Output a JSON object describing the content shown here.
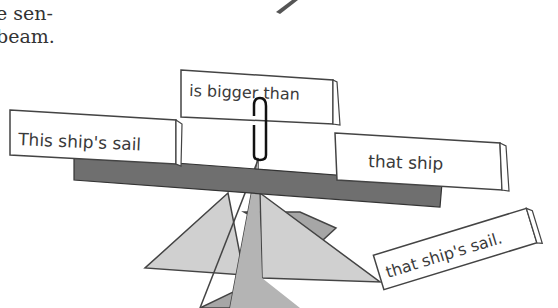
{
  "caption": {
    "line1": "e sen-",
    "line2": "beam."
  },
  "cards": {
    "subject": "This ship's sail",
    "verb": "is bigger than",
    "object": "that ship",
    "extra": "that ship's sail."
  },
  "colors": {
    "beam": "#6f6f6f",
    "base_light": "#d0d0d0",
    "base_mid": "#a6a6a6",
    "outline": "#444444",
    "card": "#ffffff",
    "text": "#3a3a3a"
  }
}
